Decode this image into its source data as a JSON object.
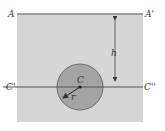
{
  "diagram": {
    "labels": {
      "A": "A",
      "A_prime": "A'",
      "C_prime": "C'",
      "C_double_prime": "C''",
      "center": "C",
      "height": "h",
      "radius": "r"
    },
    "colors": {
      "background": "#ffffff",
      "region_fill": "#d6d6d6",
      "circle_fill": "#a4a4a4",
      "circle_stroke": "#555555",
      "line": "#555555"
    },
    "geometry": {
      "region": {
        "x": 17,
        "y": 14,
        "width": 126,
        "height": 108
      },
      "line_AA": {
        "y": 14,
        "x1": 17,
        "x2": 143
      },
      "line_CC": {
        "y": 87,
        "x1": 3,
        "x2": 143
      },
      "circle": {
        "cx": 80,
        "cy": 87,
        "r": 23
      },
      "h_arrow": {
        "x": 115,
        "y1": 15,
        "y2": 86
      }
    }
  }
}
